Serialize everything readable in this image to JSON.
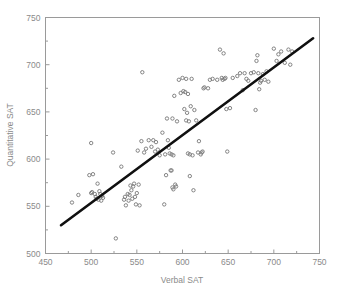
{
  "chart_data": {
    "type": "scatter",
    "title": "",
    "xlabel": "Verbal SAT",
    "ylabel": "Quantitative SAT",
    "xlim": [
      450,
      750
    ],
    "ylim": [
      500,
      750
    ],
    "xticks": [
      450,
      500,
      550,
      600,
      650,
      700,
      750
    ],
    "xtick_labels": [
      "450",
      "500",
      "550",
      "600",
      "650",
      "700",
      "750"
    ],
    "yticks": [
      500,
      550,
      600,
      650,
      700,
      750
    ],
    "ytick_labels": [
      "500",
      "550",
      "600",
      "650",
      "700",
      "750"
    ],
    "xminor_step": 25,
    "yminor_step": 25,
    "grid": false,
    "legend": "none",
    "marker": "open-circle",
    "marker_size": 3,
    "marker_color": "#777777",
    "frame_color": "#9a9a9a",
    "line_color": "#101010",
    "trendline": {
      "label": "regression-line",
      "x": [
        467,
        743
      ],
      "y": [
        530,
        728
      ],
      "width": 2.6
    },
    "x": [
      479,
      486,
      498,
      500,
      500,
      501,
      502,
      504,
      505,
      506,
      507,
      508,
      509,
      510,
      511,
      512,
      513,
      524,
      527,
      533,
      536,
      537,
      538,
      540,
      541,
      542,
      543,
      544,
      545,
      546,
      547,
      548,
      549,
      550,
      551,
      552,
      553,
      555,
      556,
      558,
      560,
      563,
      566,
      568,
      570,
      571,
      573,
      575,
      578,
      580,
      581,
      582,
      583,
      584,
      585,
      586,
      587,
      588,
      588,
      589,
      589,
      590,
      590,
      591,
      592,
      593,
      594,
      596,
      598,
      600,
      601,
      602,
      603,
      604,
      604,
      605,
      606,
      606,
      607,
      608,
      608,
      609,
      610,
      611,
      612,
      613,
      615,
      617,
      618,
      620,
      621,
      622,
      623,
      624,
      628,
      630,
      633,
      638,
      641,
      643,
      644,
      645,
      646,
      647,
      648,
      649,
      652,
      655,
      660,
      663,
      666,
      668,
      670,
      672,
      675,
      678,
      680,
      681,
      682,
      683,
      684,
      685,
      686,
      688,
      690,
      692,
      694,
      700,
      703,
      705,
      708,
      712,
      716,
      718,
      720
    ],
    "y": [
      554,
      562,
      583,
      564,
      617,
      565,
      584,
      563,
      560,
      558,
      574,
      557,
      566,
      563,
      556,
      561,
      559,
      607,
      516,
      592,
      557,
      560,
      551,
      563,
      556,
      562,
      572,
      567,
      558,
      571,
      574,
      560,
      552,
      564,
      609,
      573,
      551,
      619,
      692,
      607,
      611,
      620,
      613,
      620,
      608,
      618,
      610,
      604,
      628,
      552,
      605,
      583,
      643,
      620,
      612,
      606,
      588,
      588,
      605,
      570,
      643,
      568,
      604,
      667,
      573,
      571,
      640,
      684,
      670,
      686,
      672,
      653,
      671,
      641,
      685,
      649,
      606,
      669,
      640,
      605,
      582,
      656,
      685,
      604,
      567,
      652,
      641,
      607,
      619,
      605,
      607,
      608,
      675,
      676,
      675,
      684,
      685,
      684,
      716,
      686,
      684,
      712,
      685,
      686,
      653,
      608,
      654,
      686,
      688,
      691,
      673,
      691,
      685,
      683,
      691,
      692,
      652,
      704,
      710,
      691,
      674,
      681,
      683,
      690,
      684,
      693,
      682,
      717,
      704,
      711,
      714,
      702,
      716,
      700,
      714
    ]
  },
  "figure": {
    "width": 337,
    "height": 291
  }
}
